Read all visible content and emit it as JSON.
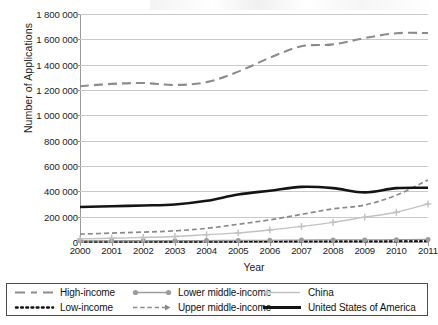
{
  "chart_data": {
    "type": "line",
    "title": "",
    "xlabel": "Year",
    "ylabel": "Number of Applications",
    "grid": true,
    "legend_position": "bottom",
    "legend_columns": 3,
    "x": [
      2000,
      2001,
      2002,
      2003,
      2004,
      2005,
      2006,
      2007,
      2008,
      2009,
      2010,
      2011
    ],
    "xtick_labels": [
      "2000",
      "2001",
      "2002",
      "2003",
      "2004",
      "2005",
      "2006",
      "2007",
      "2008",
      "2009",
      "2010",
      "2011"
    ],
    "ylim": [
      0,
      1800000
    ],
    "ytick_labels": [
      "0",
      "200 000",
      "400 000",
      "600 000",
      "800 000",
      "1 000 000",
      "1 200 000",
      "1 400 000",
      "1 600 000",
      "1 800 000"
    ],
    "ytick_values": [
      0,
      200000,
      400000,
      600000,
      800000,
      1000000,
      1200000,
      1400000,
      1600000,
      1800000
    ],
    "series": [
      {
        "name": "High-income",
        "style": "long-dash",
        "color": "#8c8c8c",
        "marker": "none",
        "width": 2.1,
        "values": [
          1230000,
          1248000,
          1255000,
          1240000,
          1262000,
          1345000,
          1455000,
          1545000,
          1560000,
          1610000,
          1648000,
          1650000
        ]
      },
      {
        "name": "Low-income",
        "style": "dotted",
        "color": "#111111",
        "marker": "none",
        "width": 2.4,
        "values": [
          3000,
          3200,
          3400,
          3600,
          4000,
          4500,
          5000,
          5600,
          6200,
          6000,
          6500,
          7000
        ]
      },
      {
        "name": "Lower middle-income",
        "style": "solid",
        "color": "#9b9b9b",
        "marker": "circle",
        "width": 1.3,
        "values": [
          9000,
          9500,
          10000,
          10500,
          11500,
          12500,
          13500,
          15000,
          16500,
          16000,
          18000,
          20000
        ]
      },
      {
        "name": "Upper middle-income",
        "style": "dash",
        "color": "#8a8a8a",
        "marker": "none",
        "width": 1.7,
        "values": [
          62000,
          70000,
          78000,
          88000,
          108000,
          140000,
          175000,
          218000,
          262000,
          292000,
          370000,
          490000
        ]
      },
      {
        "name": "China",
        "style": "solid",
        "color": "#c2c2c2",
        "marker": "plus",
        "width": 1.4,
        "values": [
          25000,
          30000,
          36000,
          44000,
          58000,
          72000,
          95000,
          123000,
          155000,
          196000,
          235000,
          300000
        ]
      },
      {
        "name": "United States of America",
        "style": "solid",
        "color": "#141414",
        "marker": "none",
        "width": 2.6,
        "values": [
          276000,
          282000,
          288000,
          296000,
          325000,
          375000,
          405000,
          435000,
          425000,
          392000,
          425000,
          428000
        ]
      }
    ]
  },
  "axes": {
    "y_title": "Number of Applications",
    "x_title": "Year"
  },
  "legend": {
    "items": [
      {
        "label": "High-income",
        "marker": "long-dash-line-gray"
      },
      {
        "label": "Lower middle-income",
        "marker": "solid-line-circle-marker-gray"
      },
      {
        "label": "China",
        "marker": "solid-line-plus-marker-lightgray"
      },
      {
        "label": "Low-income",
        "marker": "dotted-line-black"
      },
      {
        "label": "Upper middle-income",
        "marker": "dashed-line-arrow-gray"
      },
      {
        "label": "United States of America",
        "marker": "thick-solid-line-black"
      }
    ]
  }
}
